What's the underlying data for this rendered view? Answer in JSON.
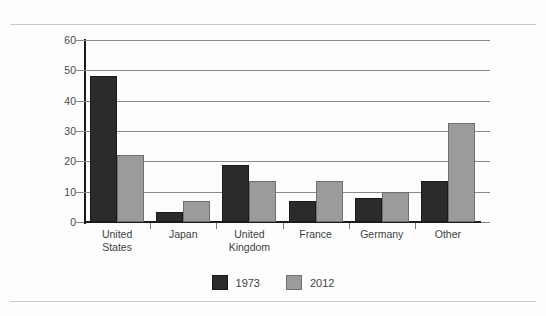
{
  "figure": {
    "background_color": "#fdfdfd",
    "rule_color": "#c9c9c9"
  },
  "legend": {
    "items": [
      {
        "label": "1973",
        "color": "#2b2b2b",
        "swatch_name": "legend-swatch-1973"
      },
      {
        "label": "2012",
        "color": "#9b9b9b",
        "swatch_name": "legend-swatch-2012"
      }
    ]
  },
  "chart_data": {
    "type": "bar",
    "title": "",
    "subtitle": "",
    "xlabel": "",
    "ylabel": "",
    "categories": [
      "United States",
      "Japan",
      "United Kingdom",
      "France",
      "Germany",
      "Other"
    ],
    "category_lines": [
      [
        "United",
        "States"
      ],
      [
        "Japan"
      ],
      [
        "United",
        "Kingdom"
      ],
      [
        "France"
      ],
      [
        "Germany"
      ],
      [
        "Other"
      ]
    ],
    "series": [
      {
        "name": "1973",
        "color": "#2b2b2b",
        "values": [
          48.3,
          3.2,
          18.9,
          6.8,
          7.8,
          13.6
        ]
      },
      {
        "name": "2012",
        "color": "#9b9b9b",
        "values": [
          22.0,
          6.8,
          13.6,
          13.6,
          9.8,
          32.7
        ]
      }
    ],
    "ylim": [
      0,
      60
    ],
    "yticks": [
      0,
      10,
      20,
      30,
      40,
      50,
      60
    ],
    "ytick_labels": [
      "0",
      "10",
      "20",
      "30",
      "40",
      "50",
      "60"
    ],
    "grid": true,
    "grid_axis": "y",
    "legend_position": "bottom-center",
    "bar_width": 27,
    "group_spacing": 66.2
  }
}
